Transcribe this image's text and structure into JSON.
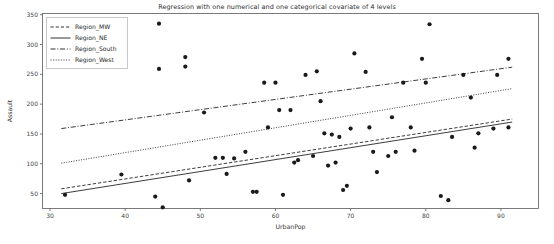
{
  "chart_data": {
    "type": "scatter",
    "title": "Regression with one numerical and one categorical covariate of 4 levels",
    "xlabel": "UrbanPop",
    "ylabel": "Assault",
    "xlim": [
      29,
      95
    ],
    "ylim": [
      25,
      352
    ],
    "xticks": [
      30,
      40,
      50,
      60,
      70,
      80,
      90
    ],
    "yticks": [
      50,
      100,
      150,
      200,
      250,
      300,
      350
    ],
    "grid": false,
    "legend_position": "upper left",
    "marker": "filled-circle",
    "marker_color": "#1a1a1a",
    "line_color": "#1a1a1a",
    "legend": [
      {
        "label": "Region_MW",
        "style": "dashed"
      },
      {
        "label": "Region_NE",
        "style": "solid"
      },
      {
        "label": "Region_South",
        "style": "dashdot"
      },
      {
        "label": "Region_West",
        "style": "dotted"
      }
    ],
    "series": [
      {
        "name": "Region_MW",
        "style": "dashed",
        "fit_line": {
          "x": [
            31.5,
            91.5
          ],
          "y": [
            58,
            175
          ]
        }
      },
      {
        "name": "Region_NE",
        "style": "solid",
        "fit_line": {
          "x": [
            31.5,
            91.5
          ],
          "y": [
            50,
            170
          ]
        }
      },
      {
        "name": "Region_South",
        "style": "dashdot",
        "fit_line": {
          "x": [
            31.5,
            91.5
          ],
          "y": [
            159,
            262
          ]
        }
      },
      {
        "name": "Region_West",
        "style": "dotted",
        "fit_line": {
          "x": [
            31.5,
            91.5
          ],
          "y": [
            101,
            226
          ]
        }
      }
    ],
    "points": [
      {
        "x": 32,
        "y": 48
      },
      {
        "x": 39.5,
        "y": 82
      },
      {
        "x": 44.5,
        "y": 335
      },
      {
        "x": 44,
        "y": 45
      },
      {
        "x": 44.5,
        "y": 259
      },
      {
        "x": 45,
        "y": 27
      },
      {
        "x": 48,
        "y": 279
      },
      {
        "x": 48,
        "y": 263
      },
      {
        "x": 48.5,
        "y": 72
      },
      {
        "x": 50.5,
        "y": 186
      },
      {
        "x": 52,
        "y": 110
      },
      {
        "x": 53,
        "y": 110
      },
      {
        "x": 53.5,
        "y": 83
      },
      {
        "x": 54.5,
        "y": 109
      },
      {
        "x": 56,
        "y": 120
      },
      {
        "x": 57,
        "y": 53
      },
      {
        "x": 57.5,
        "y": 53
      },
      {
        "x": 58.5,
        "y": 236
      },
      {
        "x": 59,
        "y": 161
      },
      {
        "x": 60,
        "y": 236
      },
      {
        "x": 60.5,
        "y": 190
      },
      {
        "x": 61,
        "y": 48
      },
      {
        "x": 62,
        "y": 190
      },
      {
        "x": 62.5,
        "y": 102
      },
      {
        "x": 63,
        "y": 106
      },
      {
        "x": 64,
        "y": 249
      },
      {
        "x": 65,
        "y": 113
      },
      {
        "x": 65.5,
        "y": 255
      },
      {
        "x": 66,
        "y": 205
      },
      {
        "x": 66.5,
        "y": 151
      },
      {
        "x": 67,
        "y": 97
      },
      {
        "x": 67.5,
        "y": 149
      },
      {
        "x": 68,
        "y": 102
      },
      {
        "x": 68.5,
        "y": 145
      },
      {
        "x": 69,
        "y": 56
      },
      {
        "x": 69.5,
        "y": 63
      },
      {
        "x": 70,
        "y": 159
      },
      {
        "x": 70.5,
        "y": 285
      },
      {
        "x": 72,
        "y": 254
      },
      {
        "x": 72.5,
        "y": 161
      },
      {
        "x": 73,
        "y": 120
      },
      {
        "x": 73.5,
        "y": 86
      },
      {
        "x": 75,
        "y": 113
      },
      {
        "x": 75.5,
        "y": 178
      },
      {
        "x": 76,
        "y": 120
      },
      {
        "x": 77,
        "y": 236
      },
      {
        "x": 78,
        "y": 161
      },
      {
        "x": 78.5,
        "y": 122
      },
      {
        "x": 79.5,
        "y": 276
      },
      {
        "x": 80,
        "y": 236
      },
      {
        "x": 80.5,
        "y": 334
      },
      {
        "x": 82,
        "y": 46
      },
      {
        "x": 83,
        "y": 39
      },
      {
        "x": 83.5,
        "y": 145
      },
      {
        "x": 85,
        "y": 249
      },
      {
        "x": 86,
        "y": 211
      },
      {
        "x": 86.5,
        "y": 127
      },
      {
        "x": 87,
        "y": 151
      },
      {
        "x": 89,
        "y": 159
      },
      {
        "x": 89.5,
        "y": 249
      },
      {
        "x": 91,
        "y": 276
      },
      {
        "x": 91,
        "y": 161
      }
    ]
  }
}
